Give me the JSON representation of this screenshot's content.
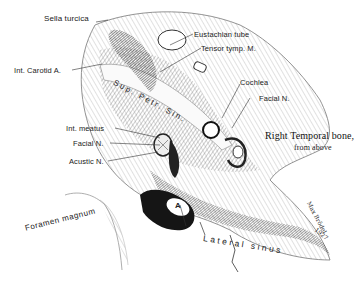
{
  "figure": {
    "title": "Right Temporal bone,",
    "subtitle": "from above",
    "signature": "Max Brödel",
    "year": "1927",
    "labels": {
      "sella_turcica": "Sella turcica",
      "int_carotid": "Int. Carotid  A.",
      "eustachian_tube": "Eustachian tube",
      "tensor_tymp": "Tensor tymp. M.",
      "cochlea": "Cochlea",
      "facial_n_right": "Facial N.",
      "sup_petr_sin": "Sup. Petr. Sin.",
      "int_meatus": "Int. meatus",
      "facial_n_left": "Facial N.",
      "acustic_n": "Acustic N.",
      "foramen_magnum": "Foramen magnum",
      "lateral_sinus": "Lateral  sinus",
      "letter_a": "A"
    }
  }
}
